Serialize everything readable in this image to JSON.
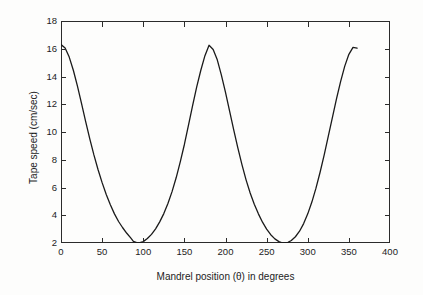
{
  "chart_data": {
    "type": "line",
    "title": "",
    "xlabel": "Mandrel position (θ) in degrees",
    "ylabel": "Tape speed (cm/sec)",
    "xlim": [
      0,
      400
    ],
    "ylim": [
      2,
      18
    ],
    "xticks": [
      0,
      50,
      100,
      150,
      200,
      250,
      300,
      350,
      400
    ],
    "xtick_labels": [
      "0",
      "50",
      "100",
      "150",
      "200",
      "250",
      "300",
      "350",
      "400"
    ],
    "yticks": [
      2,
      4,
      6,
      8,
      10,
      12,
      14,
      16,
      18
    ],
    "ytick_labels": [
      "2",
      "4",
      "6",
      "8",
      "10",
      "12",
      "14",
      "16",
      "18"
    ],
    "grid": false,
    "legend": false,
    "line_color": "#1a1a1a",
    "line_width": 1.3,
    "series": [
      {
        "name": "Tape speed",
        "x": [
          0,
          5,
          10,
          15,
          20,
          25,
          30,
          35,
          40,
          45,
          50,
          55,
          60,
          65,
          70,
          75,
          80,
          85,
          88,
          92,
          96,
          100,
          105,
          110,
          115,
          120,
          125,
          130,
          135,
          140,
          145,
          150,
          155,
          160,
          165,
          170,
          175,
          180,
          185,
          190,
          195,
          200,
          205,
          210,
          215,
          220,
          225,
          230,
          235,
          240,
          245,
          250,
          255,
          260,
          265,
          268,
          272,
          276,
          280,
          285,
          290,
          295,
          300,
          305,
          310,
          315,
          320,
          325,
          330,
          335,
          340,
          345,
          350,
          355,
          360
        ],
        "y": [
          16.3,
          16.05,
          15.4,
          14.45,
          13.3,
          12.05,
          10.75,
          9.5,
          8.35,
          7.3,
          6.35,
          5.5,
          4.75,
          4.1,
          3.55,
          3.1,
          2.7,
          2.35,
          2.12,
          2.02,
          2.02,
          2.1,
          2.32,
          2.62,
          3.02,
          3.52,
          4.12,
          4.85,
          5.7,
          6.7,
          7.85,
          9.1,
          10.5,
          11.9,
          13.25,
          14.45,
          15.5,
          16.25,
          15.95,
          15.2,
          14.1,
          12.85,
          11.5,
          10.15,
          8.85,
          7.65,
          6.55,
          5.6,
          4.8,
          4.1,
          3.5,
          3.0,
          2.6,
          2.3,
          2.1,
          2.03,
          2.0,
          2.05,
          2.18,
          2.45,
          2.85,
          3.4,
          4.1,
          4.95,
          5.95,
          7.1,
          8.35,
          9.7,
          11.05,
          12.4,
          13.65,
          14.75,
          15.6,
          16.1,
          16.05
        ]
      }
    ],
    "annotations": [
      {
        "label": "maximum near 0 deg",
        "x": 0,
        "y": 16.3
      },
      {
        "label": "minimum near 90 deg",
        "x": 90,
        "y": 2.0
      },
      {
        "label": "maximum near 180 deg",
        "x": 180,
        "y": 16.25
      },
      {
        "label": "minimum near 272 deg",
        "x": 272,
        "y": 2.0
      },
      {
        "label": "data ends at 360 deg",
        "x": 360,
        "y": 16.05
      }
    ]
  },
  "figure": {
    "background_color": "#fdfdfc",
    "axes_color": "#2b2b2b"
  }
}
